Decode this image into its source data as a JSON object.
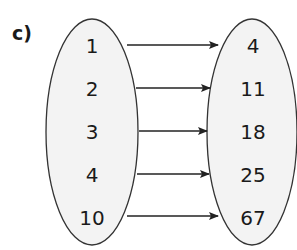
{
  "label": "c)",
  "mapping": {
    "domain": [
      "1",
      "2",
      "3",
      "4",
      "10"
    ],
    "range": [
      "4",
      "11",
      "18",
      "25",
      "67"
    ],
    "arrows": [
      {
        "from": "1",
        "to": "4"
      },
      {
        "from": "2",
        "to": "11"
      },
      {
        "from": "3",
        "to": "18"
      },
      {
        "from": "4",
        "to": "25"
      },
      {
        "from": "10",
        "to": "67"
      }
    ]
  },
  "colors": {
    "oval_fill": "#f3f3f3",
    "oval_stroke": "#333333",
    "arrow": "#222222",
    "text": "#1a1a1a"
  }
}
